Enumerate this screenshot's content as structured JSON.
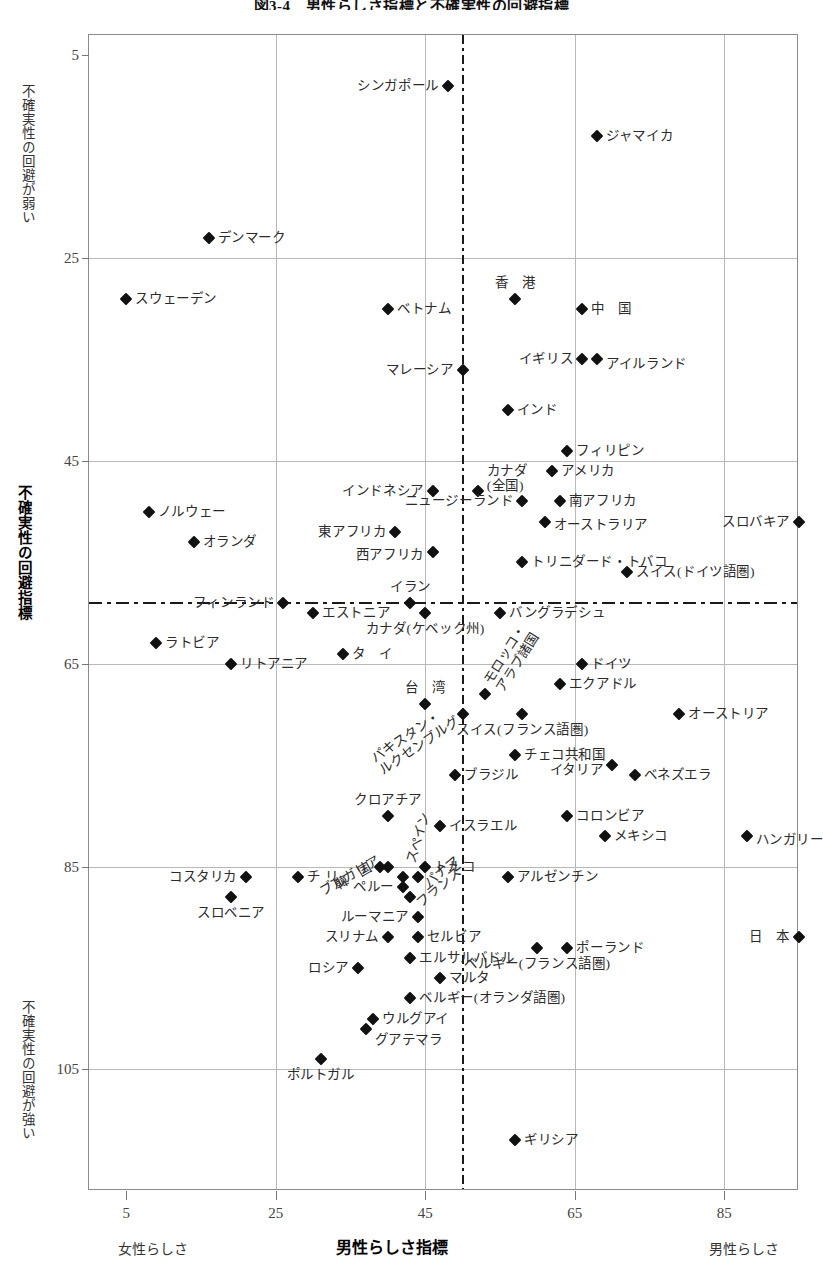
{
  "title": "図3-4　男性らしさ指標と不確実性の回避指標",
  "axes": {
    "y_title_bold": "不確実性の回避指標",
    "y_top_band": "不確実性の回避が弱い",
    "y_bottom_band": "不確実性の回避が強い",
    "x_title_bold": "男性らしさ指標",
    "x_left_band": "女性らしさ",
    "x_right_band": "男性らしさ",
    "y_ticks": [
      5,
      25,
      45,
      65,
      85,
      105
    ],
    "x_ticks": [
      5,
      25,
      45,
      65,
      85
    ]
  },
  "chart_data": {
    "type": "scatter",
    "title": "図3-4　男性らしさ指標と不確実性の回避指標",
    "xlabel": "男性らしさ指標",
    "ylabel": "不確実性の回避指標",
    "xlim": [
      0,
      95
    ],
    "ylim": [
      3,
      117
    ],
    "y_inverted": true,
    "grid": true,
    "legend": "none",
    "reference_lines": {
      "x": 50,
      "y": 59
    },
    "xticks": [
      5,
      25,
      45,
      65,
      85
    ],
    "yticks": [
      5,
      25,
      45,
      65,
      85,
      105
    ],
    "points": [
      {
        "label": "シンガポール",
        "x": 48,
        "y": 8,
        "lx": -1,
        "ly": 0,
        "align": "l"
      },
      {
        "label": "ジャマイカ",
        "x": 68,
        "y": 13,
        "lx": 1,
        "ly": 0,
        "align": "r"
      },
      {
        "label": "デンマーク",
        "x": 16,
        "y": 23,
        "lx": 1,
        "ly": 0,
        "align": "r"
      },
      {
        "label": "スウェーデン",
        "x": 5,
        "y": 29,
        "lx": 1,
        "ly": 0,
        "align": "r"
      },
      {
        "label": "香　港",
        "x": 57,
        "y": 29,
        "lx": 0,
        "ly": -1,
        "align": "c"
      },
      {
        "label": "ベトナム",
        "x": 40,
        "y": 30,
        "lx": 1,
        "ly": 0,
        "align": "r"
      },
      {
        "label": "中　国",
        "x": 66,
        "y": 30,
        "lx": 1,
        "ly": 0,
        "align": "r"
      },
      {
        "label": "イギリス",
        "x": 66,
        "y": 35,
        "lx": -1,
        "ly": 0,
        "align": "l"
      },
      {
        "label": "アイルランド",
        "x": 68,
        "y": 35,
        "lx": 1,
        "ly": 0.4,
        "align": "r"
      },
      {
        "label": "マレーシア",
        "x": 50,
        "y": 36,
        "lx": -1,
        "ly": 0,
        "align": "l"
      },
      {
        "label": "インド",
        "x": 56,
        "y": 40,
        "lx": 1,
        "ly": 0,
        "align": "r"
      },
      {
        "label": "フィリピン",
        "x": 64,
        "y": 44,
        "lx": 1,
        "ly": 0,
        "align": "r"
      },
      {
        "label": "アメリカ",
        "x": 62,
        "y": 46,
        "lx": 1,
        "ly": 0,
        "align": "r"
      },
      {
        "label": "カナダ\n(全国)",
        "x": 52,
        "y": 48,
        "lx": 1,
        "ly": -0.8,
        "align": "r"
      },
      {
        "label": "ノルウェー",
        "x": 8,
        "y": 50,
        "lx": 1,
        "ly": 0,
        "align": "r"
      },
      {
        "label": "インドネシア",
        "x": 46,
        "y": 48,
        "lx": -1,
        "ly": 0,
        "align": "l"
      },
      {
        "label": "南アフリカ",
        "x": 63,
        "y": 49,
        "lx": 1,
        "ly": 0,
        "align": "r"
      },
      {
        "label": "スロバキア",
        "x": 95,
        "y": 51,
        "lx": -1,
        "ly": 0,
        "align": "l"
      },
      {
        "label": "オランダ",
        "x": 14,
        "y": 53,
        "lx": 1,
        "ly": 0,
        "align": "r"
      },
      {
        "label": "ニュージーランド",
        "x": 58,
        "y": 49,
        "lx": -1,
        "ly": 0,
        "align": "l"
      },
      {
        "label": "オーストラリア",
        "x": 61,
        "y": 51,
        "lx": 1,
        "ly": 0.3,
        "align": "r"
      },
      {
        "label": "東アフリカ",
        "x": 41,
        "y": 52,
        "lx": -1,
        "ly": 0,
        "align": "l"
      },
      {
        "label": "西アフリカ",
        "x": 46,
        "y": 54,
        "lx": -1,
        "ly": 0.3,
        "align": "l"
      },
      {
        "label": "トリニダード・トバコ",
        "x": 58,
        "y": 55,
        "lx": 1,
        "ly": 0,
        "align": "r"
      },
      {
        "label": "スイス(ドイツ語圏)",
        "x": 72,
        "y": 56,
        "lx": 1,
        "ly": 0,
        "align": "r"
      },
      {
        "label": "フィンランド",
        "x": 26,
        "y": 59,
        "lx": -1,
        "ly": 0,
        "align": "l"
      },
      {
        "label": "エストニア",
        "x": 30,
        "y": 60,
        "lx": 1,
        "ly": 0,
        "align": "r"
      },
      {
        "label": "イラン",
        "x": 43,
        "y": 59,
        "lx": 0,
        "ly": -1,
        "align": "c"
      },
      {
        "label": "バングラデシュ",
        "x": 55,
        "y": 60,
        "lx": 1,
        "ly": 0,
        "align": "r"
      },
      {
        "label": "カナダ(ケベック州)",
        "x": 45,
        "y": 60,
        "lx": 0,
        "ly": 1,
        "align": "c"
      },
      {
        "label": "ラトビア",
        "x": 9,
        "y": 63,
        "lx": 1,
        "ly": 0,
        "align": "r"
      },
      {
        "label": "リトアニア",
        "x": 19,
        "y": 65,
        "lx": 1,
        "ly": 0,
        "align": "r"
      },
      {
        "label": "タ　イ",
        "x": 34,
        "y": 64,
        "lx": 1,
        "ly": 0,
        "align": "r"
      },
      {
        "label": "ドイツ",
        "x": 66,
        "y": 65,
        "lx": 1,
        "ly": 0,
        "align": "r"
      },
      {
        "label": "エクアドル",
        "x": 63,
        "y": 67,
        "lx": 1,
        "ly": 0,
        "align": "r"
      },
      {
        "label": "台　湾",
        "x": 45,
        "y": 69,
        "lx": 0,
        "ly": -1,
        "align": "c"
      },
      {
        "label": "モロッコ・\nアラブ諸国",
        "x": 53,
        "y": 68,
        "lx": 1,
        "ly": -0.5,
        "align": "rot"
      },
      {
        "label": "オーストリア",
        "x": 79,
        "y": 70,
        "lx": 1,
        "ly": 0,
        "align": "r"
      },
      {
        "label": "スイス(フランス語圏)",
        "x": 58,
        "y": 70,
        "lx": 0,
        "ly": 1,
        "align": "c"
      },
      {
        "label": "パキスタン・\nルクセンブルグ",
        "x": 50,
        "y": 70,
        "lx": -1,
        "ly": 0,
        "align": "rot"
      },
      {
        "label": "チェコ共和国",
        "x": 57,
        "y": 74,
        "lx": 1,
        "ly": 0,
        "align": "r"
      },
      {
        "label": "ブラジル",
        "x": 49,
        "y": 76,
        "lx": 1,
        "ly": 0,
        "align": "r"
      },
      {
        "label": "イタリア",
        "x": 70,
        "y": 75,
        "lx": -1,
        "ly": 0.4,
        "align": "l"
      },
      {
        "label": "ベネズエラ",
        "x": 73,
        "y": 76,
        "lx": 1,
        "ly": 0,
        "align": "r"
      },
      {
        "label": "クロアチア",
        "x": 40,
        "y": 80,
        "lx": 0,
        "ly": -1,
        "align": "c"
      },
      {
        "label": "コロンビア",
        "x": 64,
        "y": 80,
        "lx": 1,
        "ly": 0,
        "align": "r"
      },
      {
        "label": "イスラエル",
        "x": 47,
        "y": 81,
        "lx": 1,
        "ly": 0,
        "align": "r"
      },
      {
        "label": "スペイン",
        "x": 42,
        "y": 86,
        "lx": 0,
        "ly": -1,
        "align": "rot"
      },
      {
        "label": "ブルガリア",
        "x": 40,
        "y": 85,
        "lx": -1,
        "ly": -0.5,
        "align": "rot"
      },
      {
        "label": "韓　国",
        "x": 39,
        "y": 85,
        "lx": -1,
        "ly": 0,
        "align": "rot"
      },
      {
        "label": "メキシコ",
        "x": 69,
        "y": 82,
        "lx": 1,
        "ly": 0,
        "align": "r"
      },
      {
        "label": "ハンガリー",
        "x": 88,
        "y": 82,
        "lx": 1,
        "ly": 0.4,
        "align": "r"
      },
      {
        "label": "トルコ",
        "x": 45,
        "y": 85,
        "lx": 1,
        "ly": 0,
        "align": "r"
      },
      {
        "label": "コスタリカ",
        "x": 21,
        "y": 86,
        "lx": -1,
        "ly": 0,
        "align": "l"
      },
      {
        "label": "アルゼンチン",
        "x": 56,
        "y": 86,
        "lx": 1,
        "ly": 0,
        "align": "r"
      },
      {
        "label": "チリ",
        "x": 28,
        "y": 86,
        "lx": 1,
        "ly": 0,
        "align": "sp"
      },
      {
        "label": "ペルー",
        "x": 42,
        "y": 87,
        "lx": -1,
        "ly": 0,
        "align": "l"
      },
      {
        "label": "パナマ",
        "x": 44,
        "y": 86,
        "lx": 1,
        "ly": 0.6,
        "align": "rot"
      },
      {
        "label": "スロベニア",
        "x": 19,
        "y": 88,
        "lx": 0,
        "ly": 1,
        "align": "c"
      },
      {
        "label": "フランス",
        "x": 43,
        "y": 88,
        "lx": 1,
        "ly": 0.6,
        "align": "rot"
      },
      {
        "label": "ルーマニア",
        "x": 44,
        "y": 90,
        "lx": -1,
        "ly": 0,
        "align": "l"
      },
      {
        "label": "スリナム",
        "x": 40,
        "y": 92,
        "lx": -1,
        "ly": 0,
        "align": "l"
      },
      {
        "label": "セルビア",
        "x": 44,
        "y": 92,
        "lx": 1,
        "ly": 0,
        "align": "r"
      },
      {
        "label": "ポーランド",
        "x": 64,
        "y": 93,
        "lx": 1,
        "ly": 0,
        "align": "r"
      },
      {
        "label": "ベルギー(フランス語圏)",
        "x": 60,
        "y": 93,
        "lx": 0,
        "ly": 1,
        "align": "c"
      },
      {
        "label": "日　本",
        "x": 95,
        "y": 92,
        "lx": -1,
        "ly": 0,
        "align": "l"
      },
      {
        "label": "エルサルバドル",
        "x": 43,
        "y": 94,
        "lx": 1,
        "ly": 0,
        "align": "r"
      },
      {
        "label": "ロシア",
        "x": 36,
        "y": 95,
        "lx": -1,
        "ly": 0,
        "align": "l"
      },
      {
        "label": "マルタ",
        "x": 47,
        "y": 96,
        "lx": 1,
        "ly": 0,
        "align": "r"
      },
      {
        "label": "ベルギー(オランダ語圏)",
        "x": 43,
        "y": 98,
        "lx": 1,
        "ly": 0,
        "align": "r"
      },
      {
        "label": "ウルグアイ",
        "x": 38,
        "y": 100,
        "lx": 1,
        "ly": 0,
        "align": "r"
      },
      {
        "label": "グアテマラ",
        "x": 37,
        "y": 101,
        "lx": 1,
        "ly": 1,
        "align": "r"
      },
      {
        "label": "ポルトガル",
        "x": 31,
        "y": 104,
        "lx": 0,
        "ly": 1,
        "align": "c"
      },
      {
        "label": "ギリシア",
        "x": 57,
        "y": 112,
        "lx": 1,
        "ly": 0,
        "align": "r"
      }
    ]
  }
}
